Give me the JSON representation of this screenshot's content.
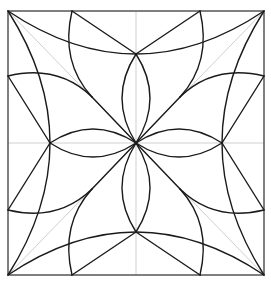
{
  "diagram": {
    "title": "",
    "type": "quilt-block-geometric-pattern",
    "colors": {
      "background": "#ffffff",
      "border": "#555555",
      "guides": "#cfcfcf",
      "lines": "#1a1a1a"
    },
    "square": {
      "x": 8,
      "y": 11,
      "width": 256,
      "height": 264
    },
    "center": {
      "x": 136,
      "y": 143
    },
    "guides": [
      "vertical-center-line",
      "horizontal-center-line",
      "diagonal-tl-br",
      "diagonal-tr-bl"
    ],
    "symmetry": "4-fold",
    "elements": [
      "four large corner-to-corner arcs",
      "four center petals (lenses)",
      "eight edge-to-diagonal arcs",
      "eight straight spokes"
    ]
  }
}
